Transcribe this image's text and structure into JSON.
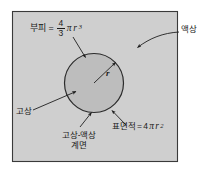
{
  "figure": {
    "frame": {
      "fill": "#cfcfcf",
      "stroke": "#3a3a3a"
    },
    "sphere": {
      "fill": "#bdbdbd",
      "stroke": "#2b2b2b"
    },
    "line_color": "#1f1f1f",
    "text_color": "#1a1a1a"
  },
  "labels": {
    "volume": {
      "term": "부피",
      "equals": "=",
      "numerator": "4",
      "denominator": "3",
      "pi": "π",
      "variable": "r",
      "exponent": "3"
    },
    "surface": {
      "term": "표면적",
      "equals": "=",
      "coefficient": "4",
      "pi": "π",
      "variable": "r",
      "exponent": "2"
    },
    "radius": "r",
    "liquid_phase": "액상",
    "solid_phase": "고상",
    "interface_line1": "고상-액상",
    "interface_line2": "계면"
  }
}
